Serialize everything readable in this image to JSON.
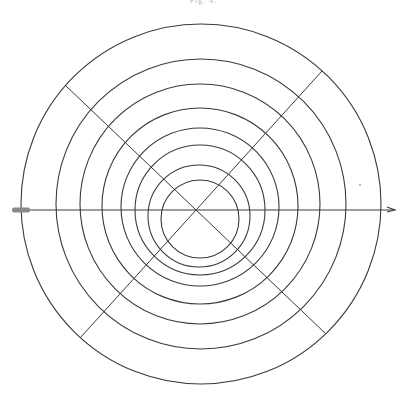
{
  "figure": {
    "label": "Fig. 4.",
    "stroke_color": "#3a3a3a",
    "background": "#ffffff",
    "axis": {
      "y": 210,
      "x_start": 12,
      "x_end": 395,
      "tail_marker": {
        "x": 12,
        "width": 18,
        "height": 5,
        "color": "#8a8a8a"
      },
      "arrow_head": {
        "x": 395
      }
    },
    "cross_center": {
      "x": 195,
      "y": 210
    },
    "circles": [
      {
        "cx": 201,
        "cy": 204,
        "r": 180
      },
      {
        "cx": 201,
        "cy": 204,
        "r": 145
      },
      {
        "cx": 200,
        "cy": 204,
        "r": 120
      },
      {
        "cx": 200,
        "cy": 206,
        "r": 98
      },
      {
        "cx": 200,
        "cy": 207,
        "r": 79
      },
      {
        "cx": 200,
        "cy": 210,
        "r": 65
      },
      {
        "cx": 199,
        "cy": 216,
        "r": 51
      },
      {
        "cx": 200,
        "cy": 219,
        "r": 39
      }
    ],
    "diagonals": [
      {
        "x1": 65,
        "y1": 85,
        "x2": 325,
        "y2": 333
      },
      {
        "x1": 322,
        "y1": 71,
        "x2": 80,
        "y2": 338
      }
    ],
    "speck": {
      "x": 360,
      "y": 185
    }
  }
}
